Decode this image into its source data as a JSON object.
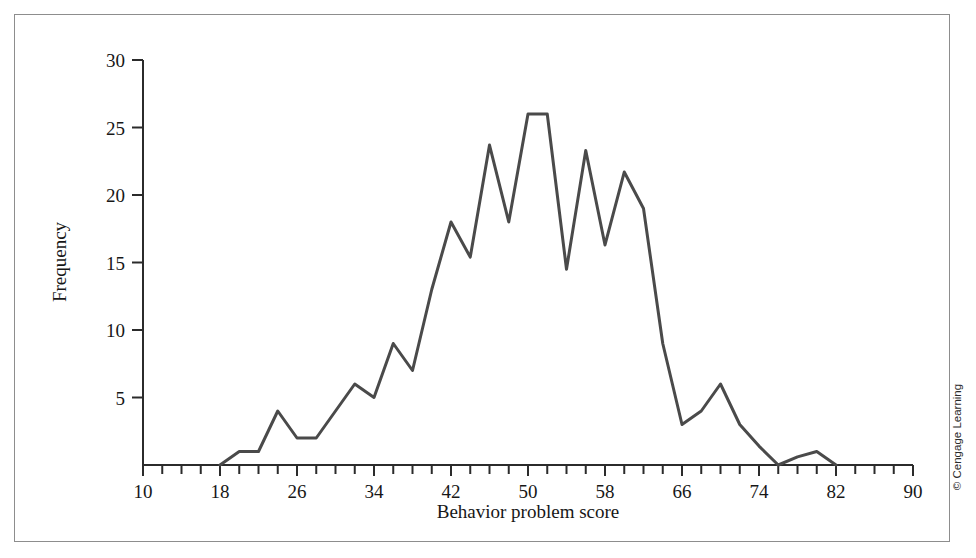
{
  "figure": {
    "credit": "© Cengage Learning"
  },
  "chart_data": {
    "type": "line",
    "title": "",
    "xlabel": "Behavior problem score",
    "ylabel": "Frequency",
    "xlim": [
      10,
      90
    ],
    "ylim": [
      0,
      30
    ],
    "x_tick_step": 2,
    "x_label_step": 8,
    "y_tick_step": 5,
    "grid": false,
    "legend": null,
    "x_tick_labels": [
      "10",
      "18",
      "26",
      "34",
      "42",
      "50",
      "58",
      "66",
      "74",
      "82",
      "90"
    ],
    "x_tick_values": [
      10,
      18,
      26,
      34,
      42,
      50,
      58,
      66,
      74,
      82,
      90
    ],
    "y_tick_labels": [
      "5",
      "10",
      "15",
      "20",
      "25",
      "30"
    ],
    "y_tick_values": [
      5,
      10,
      15,
      20,
      25,
      30
    ],
    "series": [
      {
        "name": "Frequency",
        "color": "#4a4a4a",
        "x": [
          18,
          20,
          22,
          24,
          26,
          28,
          30,
          32,
          34,
          36,
          38,
          40,
          42,
          44,
          46,
          48,
          50,
          52,
          54,
          56,
          58,
          60,
          62,
          64,
          66,
          68,
          70,
          72,
          74,
          76,
          78,
          80,
          82
        ],
        "values": [
          0,
          1,
          1,
          4,
          2,
          2,
          4,
          6,
          5,
          9,
          7,
          13,
          18,
          15.4,
          23.7,
          18,
          26,
          26,
          14.5,
          23.3,
          16.3,
          21.7,
          19,
          9,
          3,
          4,
          6,
          3,
          1.4,
          0,
          0.6,
          1,
          0
        ]
      }
    ]
  }
}
